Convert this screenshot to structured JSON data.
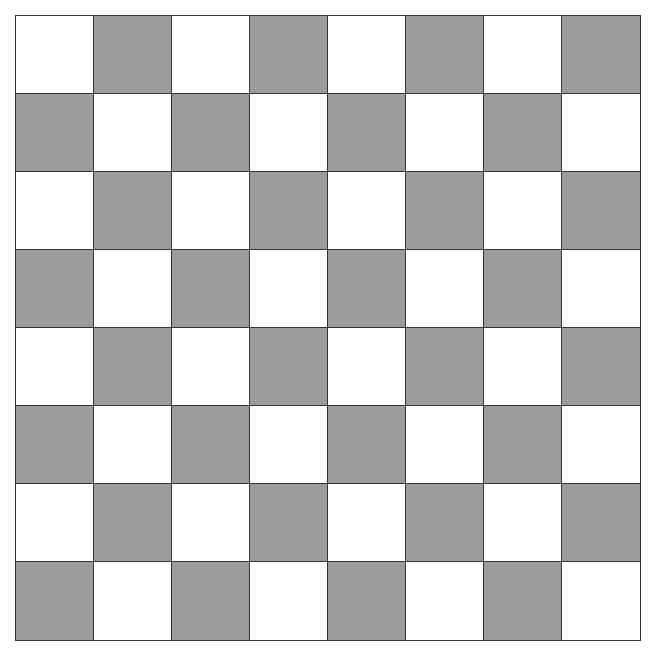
{
  "board": {
    "rows": 8,
    "cols": 8,
    "colors": {
      "light": "#ffffff",
      "dark": "#9b9b9b",
      "grid_line": "#333333"
    },
    "top_left_color": "light",
    "pieces": []
  }
}
